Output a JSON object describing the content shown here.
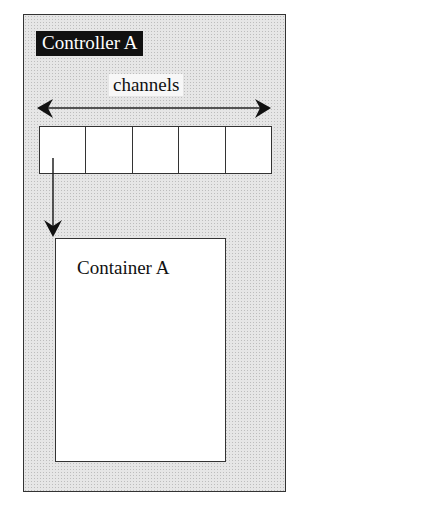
{
  "diagram": {
    "controller": {
      "label": "Controller A"
    },
    "channels": {
      "label": "channels",
      "count": 5
    },
    "container": {
      "label": "Container A"
    },
    "colors": {
      "border": "#333333",
      "label_bg": "#111111",
      "label_fg": "#ffffff",
      "fill": "#e6e6e6"
    }
  }
}
